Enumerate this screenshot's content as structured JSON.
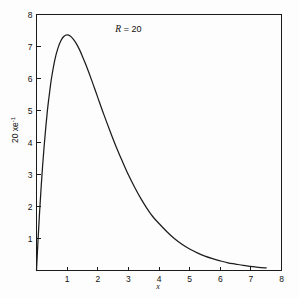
{
  "figure": {
    "background_color": "#fdfdfd",
    "line_color": "#1c1c1c",
    "axis_color": "#1a1a1a"
  },
  "chart_data": {
    "type": "line",
    "title": "",
    "subtitle": "",
    "xlabel": "x",
    "ylabel": "20 xe⁻¹",
    "ylabel_parts": {
      "base": "20 xe",
      "exponent": "-1"
    },
    "xlim": [
      0,
      8
    ],
    "ylim": [
      0,
      8
    ],
    "grid": false,
    "legend": null,
    "legend_position": "none",
    "xticks": [
      0,
      1,
      2,
      3,
      4,
      5,
      6,
      7,
      8
    ],
    "xtick_labels": [
      "",
      "1",
      "2",
      "3",
      "4",
      "5",
      "6",
      "7",
      "8"
    ],
    "yticks": [
      0,
      1,
      2,
      3,
      4,
      5,
      6,
      7,
      8
    ],
    "ytick_labels": [
      "",
      "1",
      "2",
      "3",
      "4",
      "5",
      "6",
      "7",
      "8"
    ],
    "annotations": [
      {
        "name": "R-parameter-label",
        "symbol": "R",
        "text": "R = 20",
        "equals": "=",
        "value": "20",
        "x": 3.0,
        "y": 7.45
      }
    ],
    "series": [
      {
        "name": "20 x e^{-x}",
        "formula": "y = 20 x e^{-x}",
        "x": [
          0.0,
          0.05,
          0.1,
          0.15,
          0.2,
          0.25,
          0.3,
          0.35,
          0.4,
          0.45,
          0.5,
          0.6,
          0.7,
          0.8,
          0.9,
          1.0,
          1.1,
          1.2,
          1.3,
          1.4,
          1.5,
          1.6,
          1.7,
          1.8,
          1.9,
          2.0,
          2.2,
          2.4,
          2.6,
          2.8,
          3.0,
          3.2,
          3.4,
          3.6,
          3.8,
          4.0,
          4.25,
          4.5,
          4.75,
          5.0,
          5.25,
          5.5,
          5.75,
          6.0,
          6.25,
          6.5,
          6.75,
          7.0,
          7.25,
          7.5
        ],
        "y": [
          0.0,
          0.95,
          1.81,
          2.58,
          3.28,
          3.89,
          4.44,
          4.94,
          5.36,
          5.74,
          6.07,
          6.59,
          6.95,
          7.19,
          7.32,
          7.36,
          7.33,
          7.23,
          7.09,
          6.91,
          6.69,
          6.46,
          6.21,
          5.95,
          5.68,
          5.41,
          4.87,
          4.36,
          3.87,
          3.42,
          2.99,
          2.61,
          2.26,
          1.95,
          1.68,
          1.47,
          1.22,
          1.0,
          0.82,
          0.67,
          0.55,
          0.45,
          0.37,
          0.3,
          0.24,
          0.2,
          0.16,
          0.13,
          0.1,
          0.08
        ]
      }
    ]
  }
}
